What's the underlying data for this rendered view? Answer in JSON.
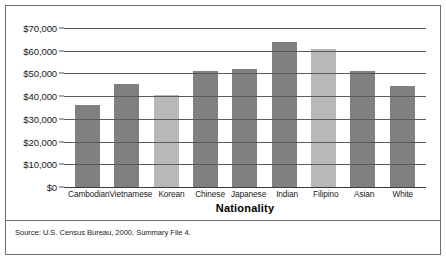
{
  "chart_data": {
    "type": "bar",
    "title": "",
    "xlabel": "Nationality",
    "ylabel": "",
    "categories": [
      "Cambodian",
      "Vietnamese",
      "Korean",
      "Chinese",
      "Japanese",
      "Indian",
      "Filipino",
      "Asian",
      "White"
    ],
    "values": [
      36000,
      45500,
      40300,
      51000,
      51800,
      63700,
      60600,
      51000,
      44500
    ],
    "bar_colors": [
      "#808080",
      "#808080",
      "#b8b8b8",
      "#808080",
      "#808080",
      "#808080",
      "#b8b8b8",
      "#808080",
      "#808080"
    ],
    "ylim": [
      0,
      70000
    ],
    "ytick_values": [
      70000,
      60000,
      50000,
      40000,
      30000,
      20000,
      10000,
      0
    ],
    "ytick_labels": [
      "$70,000",
      "$60,000",
      "$50,000",
      "$40,000",
      "$30,000",
      "$20,000",
      "$10,000",
      "$0"
    ],
    "grid": true,
    "legend": "none",
    "source_note": "Source: U.S. Census Bureau, 2000, Summary File 4."
  },
  "colors": {
    "bar_dark": "#808080",
    "bar_light": "#b8b8b8",
    "frame": "#6e6e6e",
    "gridline": "#5a5a5a",
    "text": "#1a1a1a"
  }
}
